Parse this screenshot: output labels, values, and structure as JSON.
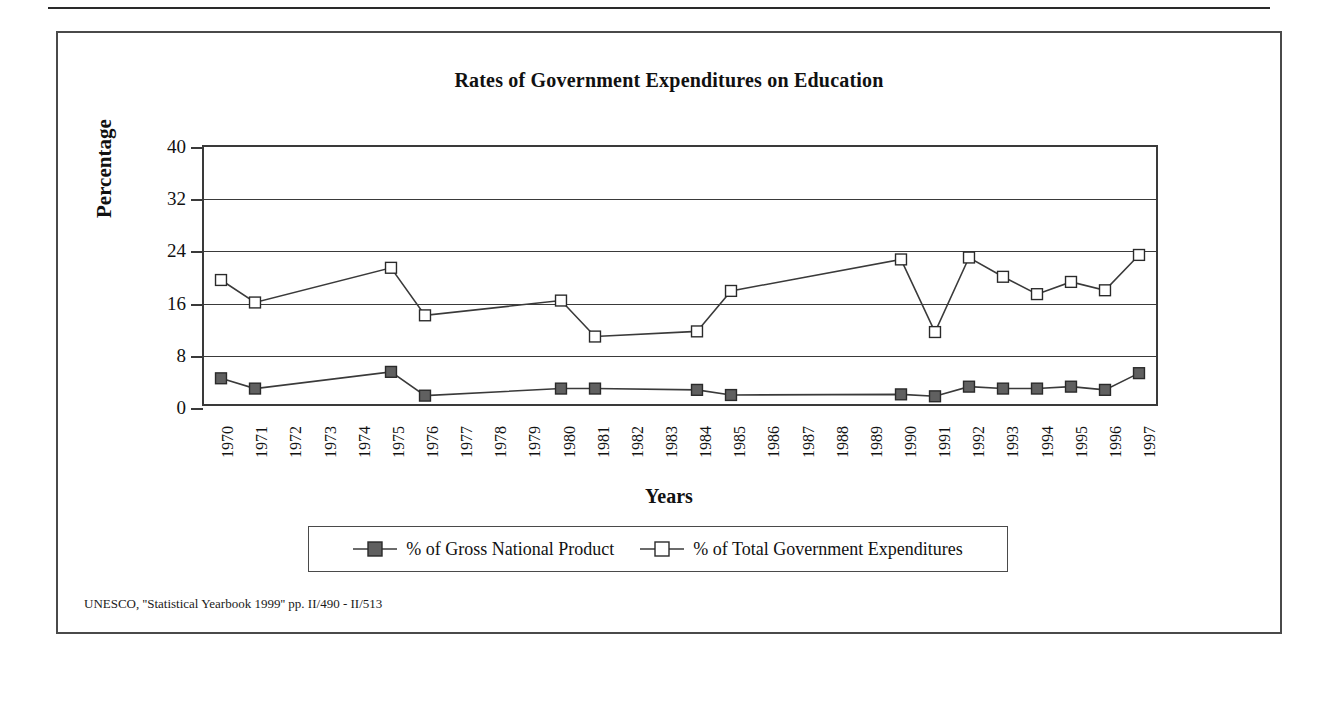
{
  "figure": {
    "title": "Rates of Government Expenditures on Education",
    "source_note": "UNESCO, ''Statistical Yearbook 1999'' pp. II/490 - II/513"
  },
  "axes": {
    "x_title": "Years",
    "y_title": "Percentage",
    "y_ticks": [
      "0",
      "8",
      "16",
      "24",
      "32",
      "40"
    ],
    "x_ticks": [
      "1970",
      "1971",
      "1972",
      "1973",
      "1974",
      "1975",
      "1976",
      "1977",
      "1978",
      "1979",
      "1980",
      "1981",
      "1982",
      "1983",
      "1984",
      "1985",
      "1986",
      "1987",
      "1988",
      "1989",
      "1990",
      "1991",
      "1992",
      "1993",
      "1994",
      "1995",
      "1996",
      "1997"
    ]
  },
  "legend": {
    "entries": [
      {
        "label": "% of Gross National Product",
        "marker": "filled-square-marker",
        "color": "#606060"
      },
      {
        "label": "% of Total Government Expenditures",
        "marker": "open-square-marker",
        "color": "#ffffff"
      }
    ]
  },
  "chart_data": {
    "type": "line",
    "title": "Rates of Government Expenditures on Education",
    "xlabel": "Years",
    "ylabel": "Percentage",
    "ylim": [
      0,
      40
    ],
    "ytick_step": 8,
    "grid": true,
    "legend_position": "bottom",
    "x": [
      "1970",
      "1971",
      "1972",
      "1973",
      "1974",
      "1975",
      "1976",
      "1977",
      "1978",
      "1979",
      "1980",
      "1981",
      "1982",
      "1983",
      "1984",
      "1985",
      "1986",
      "1987",
      "1988",
      "1989",
      "1990",
      "1991",
      "1992",
      "1993",
      "1994",
      "1995",
      "1996",
      "1997"
    ],
    "series": [
      {
        "name": "% of Gross National Product",
        "marker": "filled-square",
        "color": "#606060",
        "points": [
          {
            "x": "1970",
            "y": 4.0
          },
          {
            "x": "1971",
            "y": 2.4
          },
          {
            "x": "1975",
            "y": 5.0
          },
          {
            "x": "1976",
            "y": 1.3
          },
          {
            "x": "1980",
            "y": 2.4
          },
          {
            "x": "1981",
            "y": 2.4
          },
          {
            "x": "1984",
            "y": 2.2
          },
          {
            "x": "1985",
            "y": 1.4
          },
          {
            "x": "1990",
            "y": 1.5
          },
          {
            "x": "1991",
            "y": 1.2
          },
          {
            "x": "1992",
            "y": 2.7
          },
          {
            "x": "1993",
            "y": 2.4
          },
          {
            "x": "1994",
            "y": 2.4
          },
          {
            "x": "1995",
            "y": 2.7
          },
          {
            "x": "1996",
            "y": 2.2
          },
          {
            "x": "1997",
            "y": 4.8
          }
        ]
      },
      {
        "name": "% of Total Government Expenditures",
        "marker": "open-square",
        "color": "#ffffff",
        "points": [
          {
            "x": "1970",
            "y": 19.3
          },
          {
            "x": "1971",
            "y": 15.8
          },
          {
            "x": "1975",
            "y": 21.2
          },
          {
            "x": "1976",
            "y": 13.8
          },
          {
            "x": "1980",
            "y": 16.1
          },
          {
            "x": "1981",
            "y": 10.5
          },
          {
            "x": "1984",
            "y": 11.3
          },
          {
            "x": "1985",
            "y": 17.6
          },
          {
            "x": "1990",
            "y": 22.5
          },
          {
            "x": "1991",
            "y": 11.2
          },
          {
            "x": "1992",
            "y": 22.8
          },
          {
            "x": "1993",
            "y": 19.8
          },
          {
            "x": "1994",
            "y": 17.1
          },
          {
            "x": "1995",
            "y": 19.0
          },
          {
            "x": "1996",
            "y": 17.7
          },
          {
            "x": "1997",
            "y": 23.2
          }
        ]
      }
    ]
  }
}
